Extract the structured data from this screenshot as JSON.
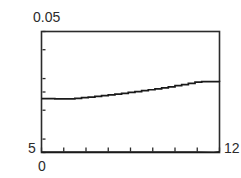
{
  "chart_data": {
    "type": "line",
    "title": "",
    "xlabel": "",
    "ylabel": "",
    "xlim": [
      0,
      12
    ],
    "ylim": [
      5,
      0.05
    ],
    "grid": false,
    "legend": null,
    "axis_labels": {
      "y_max": "0.05",
      "y_min": "5",
      "x_min": "0",
      "x_max": "12"
    },
    "x_ticks": [
      0,
      1.5,
      3,
      4.5,
      6,
      7.5,
      9,
      10.5,
      12
    ],
    "y_ticks": [
      0.05,
      0.1,
      0.3,
      0.5,
      1.0,
      3.0,
      5.0
    ],
    "series": [
      {
        "name": "upper-curve",
        "style": "stepped",
        "x": [
          0.0,
          0.45,
          0.9,
          1.35,
          1.8,
          2.25,
          2.7,
          3.15,
          3.6,
          4.05,
          4.5,
          4.95,
          5.4,
          5.85,
          6.3,
          6.75,
          7.2,
          7.65,
          8.1,
          8.55,
          9.0,
          9.45,
          9.9,
          10.35,
          10.8,
          11.25,
          11.7,
          12.0
        ],
        "y": [
          0.645,
          0.645,
          0.652,
          0.652,
          0.652,
          0.637,
          0.621,
          0.606,
          0.59,
          0.574,
          0.557,
          0.541,
          0.525,
          0.508,
          0.492,
          0.475,
          0.459,
          0.443,
          0.426,
          0.41,
          0.393,
          0.377,
          0.361,
          0.344,
          0.336,
          0.336,
          0.336,
          0.34
        ]
      },
      {
        "name": "baseline-curve",
        "style": "flat",
        "x": [
          0.0,
          1.5,
          3.0,
          4.5,
          6.0,
          7.5,
          9.0,
          10.5,
          11.6,
          12.0
        ],
        "y": [
          4.93,
          4.94,
          4.94,
          4.94,
          4.94,
          4.94,
          4.94,
          4.94,
          4.95,
          4.9
        ]
      }
    ],
    "colors": {
      "frame": "#2b2b2b",
      "curve": "#1a1a1a",
      "background": "#ffffff",
      "text": "#2b2b2b"
    }
  }
}
